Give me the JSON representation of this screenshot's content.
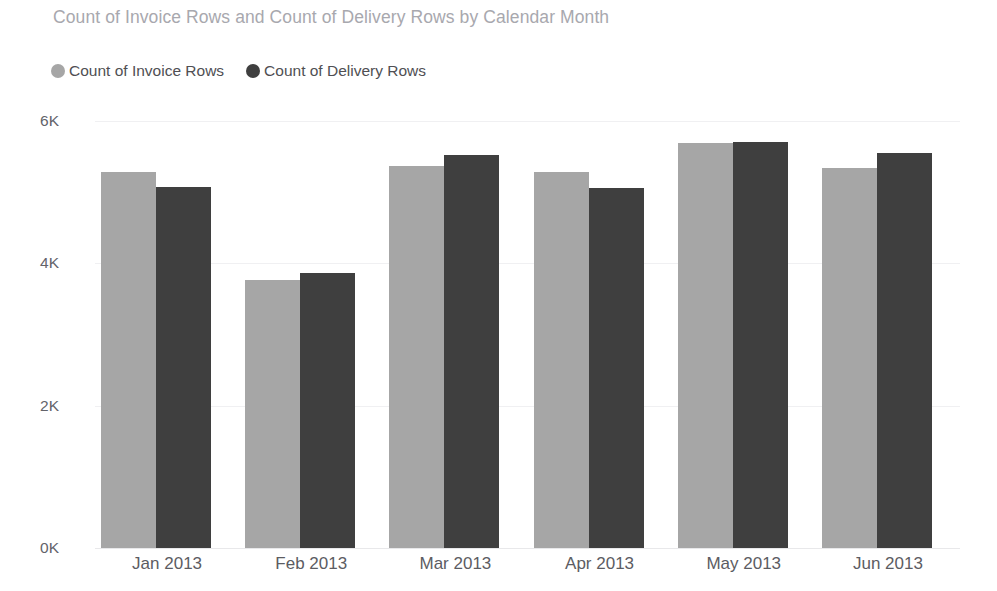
{
  "chart_data": {
    "type": "bar",
    "title": "Count of Invoice Rows and Count of Delivery Rows by Calendar Month",
    "xlabel": "",
    "ylabel": "",
    "categories": [
      "Jan 2013",
      "Feb 2013",
      "Mar 2013",
      "Apr 2013",
      "May 2013",
      "Jun 2013"
    ],
    "series": [
      {
        "name": "Count of Invoice Rows",
        "color": "#a6a6a6",
        "values": [
          5287,
          3769,
          5372,
          5287,
          5695,
          5344
        ]
      },
      {
        "name": "Count of Delivery Rows",
        "color": "#3f3f3f",
        "values": [
          5077,
          3867,
          5527,
          5063,
          5710,
          5555
        ]
      }
    ],
    "ylim": [
      0,
      6000
    ],
    "yticks": [
      0,
      2000,
      4000,
      6000
    ],
    "ytick_labels": [
      "0K",
      "2K",
      "4K",
      "6K"
    ],
    "grid": true,
    "legend_position": "top-left",
    "orientation": "vertical",
    "grouping": "grouped"
  },
  "legend": {
    "items": [
      {
        "label": "Count of Invoice Rows",
        "marker": "circle-marker",
        "color": "#a6a6a6"
      },
      {
        "label": "Count of Delivery Rows",
        "marker": "circle-marker",
        "color": "#3f3f3f"
      }
    ]
  },
  "colors": {
    "title": "#a8a8ae",
    "axis_text": "#63636a",
    "gridline": "#f0f0f2",
    "baseline": "#e8e8ea",
    "background": "#ffffff",
    "series_invoice": "#a6a6a6",
    "series_delivery": "#3f3f3f"
  }
}
